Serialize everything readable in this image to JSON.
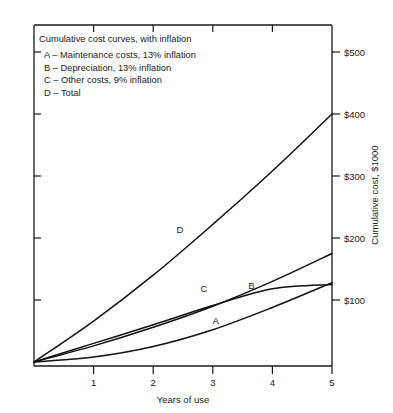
{
  "chart_data": {
    "type": "line",
    "title": "Cumulative cost curves, with inflation",
    "xlabel": "Years of use",
    "ylabel": "Cumulative cost, $1000",
    "xlim": [
      0,
      5
    ],
    "ylim": [
      0,
      500
    ],
    "grid": false,
    "legend_position": "top-left-inside",
    "x_ticks": [
      "1",
      "2",
      "3",
      "4",
      "5"
    ],
    "x_tick_values": [
      1,
      2,
      3,
      4,
      5
    ],
    "y_ticks": [
      "$100",
      "$200",
      "$300",
      "$400",
      "$500"
    ],
    "y_tick_values": [
      100,
      200,
      300,
      400,
      500
    ],
    "x": [
      0,
      1,
      2,
      3,
      4,
      5
    ],
    "series": [
      {
        "name": "A",
        "label": "A – Maintenance costs, 13% inflation",
        "tag": "A",
        "values": [
          0,
          8,
          25,
          52,
          88,
          128
        ]
      },
      {
        "name": "B",
        "label": "B – Depreciation, 13% inflation",
        "tag": "B",
        "values": [
          0,
          26,
          56,
          90,
          130,
          175
        ]
      },
      {
        "name": "C",
        "label": "C – Other costs, 9% inflation",
        "tag": "C",
        "values": [
          0,
          30,
          60,
          91,
          118,
          125
        ]
      },
      {
        "name": "D",
        "label": "D – Total",
        "tag": "D",
        "values": [
          0,
          66,
          140,
          222,
          308,
          400
        ]
      }
    ],
    "annotations": [
      {
        "text": "A",
        "x": 3.05,
        "y": 62
      },
      {
        "text": "B",
        "x": 3.65,
        "y": 118
      },
      {
        "text": "C",
        "x": 2.85,
        "y": 113
      },
      {
        "text": "D",
        "x": 2.45,
        "y": 208
      }
    ]
  },
  "legend": {
    "title": "Cumulative cost curves, with inflation",
    "entries": [
      "A – Maintenance costs, 13% inflation",
      "B – Depreciation, 13% inflation",
      "C – Other costs, 9% inflation",
      "D – Total"
    ]
  },
  "axes": {
    "x_title": "Years of use",
    "y_title": "Cumulative cost, $1000"
  }
}
